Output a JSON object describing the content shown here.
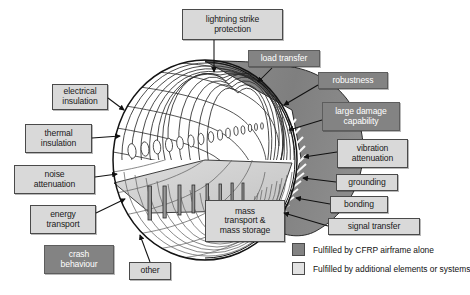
{
  "figure": {
    "colors": {
      "shell_dark": "#838383",
      "box_light_fill": "#d9d9d9",
      "box_dark_fill": "#838383",
      "box_border": "#4a4a4a",
      "floor_fill": "#d0d0d0",
      "background": "#ffffff",
      "line": "#1a1a1a"
    }
  },
  "labels": [
    {
      "id": "lightning-strike-protection",
      "text": "lightning strike\nprotection",
      "kind": "light",
      "x": 182,
      "y": 9,
      "w": 101,
      "h": 31,
      "font": 8.6
    },
    {
      "id": "load-transfer",
      "text": "load transfer",
      "kind": "dark",
      "x": 248,
      "y": 50,
      "w": 72,
      "h": 17,
      "font": 8.6
    },
    {
      "id": "robustness",
      "text": "robustness",
      "kind": "dark",
      "x": 318,
      "y": 72,
      "w": 70,
      "h": 17,
      "font": 8.6
    },
    {
      "id": "large-damage-capability",
      "text": "large damage\ncapability",
      "kind": "dark",
      "x": 322,
      "y": 102,
      "w": 78,
      "h": 29,
      "font": 8.6
    },
    {
      "id": "vibration-attenuation",
      "text": "vibration\nattenuation",
      "kind": "light",
      "x": 337,
      "y": 139,
      "w": 71,
      "h": 29,
      "font": 8.6
    },
    {
      "id": "grounding",
      "text": "grounding",
      "kind": "light",
      "x": 336,
      "y": 174,
      "w": 62,
      "h": 17,
      "font": 8.6
    },
    {
      "id": "bonding",
      "text": "bonding",
      "kind": "light",
      "x": 330,
      "y": 196,
      "w": 58,
      "h": 17,
      "font": 8.6
    },
    {
      "id": "signal-transfer",
      "text": "signal transfer",
      "kind": "light",
      "x": 328,
      "y": 218,
      "w": 92,
      "h": 17,
      "font": 8.6
    },
    {
      "id": "mass-transport-and-storage",
      "text": "mass\ntransport &\nmass storage",
      "kind": "light",
      "x": 205,
      "y": 200,
      "w": 80,
      "h": 42,
      "font": 8.6
    },
    {
      "id": "electrical-insulation",
      "text": "electrical\ninsulation",
      "kind": "light",
      "x": 52,
      "y": 84,
      "w": 56,
      "h": 26,
      "font": 8.6
    },
    {
      "id": "thermal-insulation",
      "text": "thermal\ninsulation",
      "kind": "light",
      "x": 25,
      "y": 124,
      "w": 67,
      "h": 29,
      "font": 8.6
    },
    {
      "id": "noise-attenuation",
      "text": "noise\nattenuation",
      "kind": "light",
      "x": 14,
      "y": 165,
      "w": 81,
      "h": 29,
      "font": 8.6
    },
    {
      "id": "energy-transport",
      "text": "energy\ntransport",
      "kind": "light",
      "x": 30,
      "y": 205,
      "w": 66,
      "h": 29,
      "font": 8.6
    },
    {
      "id": "crash-behaviour",
      "text": "crash\nbehaviour",
      "kind": "dark",
      "x": 44,
      "y": 245,
      "w": 70,
      "h": 29,
      "font": 8.6
    },
    {
      "id": "other",
      "text": "other",
      "kind": "light",
      "x": 129,
      "y": 262,
      "w": 42,
      "h": 18,
      "font": 8.6
    }
  ],
  "legend": {
    "items": [
      {
        "id": "legend-cfrp-alone",
        "swatch": "dark",
        "text": "Fulfilled by CFRP airframe alone"
      },
      {
        "id": "legend-additional",
        "swatch": "light",
        "text": "Fulfilled by additional elements or systems"
      }
    ]
  },
  "illustration": {
    "name": "aircraft-fuselage-barrel-cutaway",
    "parts": [
      "cylindrical-fuselage-barrel",
      "frame-and-stringer-grid",
      "cabin-windows",
      "cabin-floor",
      "cargo-hold-struts",
      "cfrp-outer-shell"
    ]
  }
}
